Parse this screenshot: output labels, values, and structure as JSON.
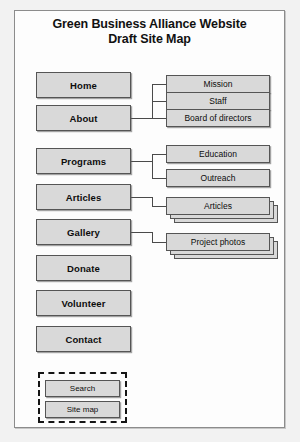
{
  "document": {
    "title_line1": "Green Business Alliance Website",
    "title_line2": "Draft Site Map"
  },
  "sitemap": {
    "primary_nodes": [
      {
        "id": "home",
        "label": "Home"
      },
      {
        "id": "about",
        "label": "About"
      },
      {
        "id": "programs",
        "label": "Programs"
      },
      {
        "id": "articles",
        "label": "Articles"
      },
      {
        "id": "gallery",
        "label": "Gallery"
      },
      {
        "id": "donate",
        "label": "Donate"
      },
      {
        "id": "volunteer",
        "label": "Volunteer"
      },
      {
        "id": "contact",
        "label": "Contact"
      }
    ],
    "about_children": [
      {
        "id": "mission",
        "label": "Mission"
      },
      {
        "id": "staff",
        "label": "Staff"
      },
      {
        "id": "board",
        "label": "Board of  directors"
      }
    ],
    "programs_children": [
      {
        "id": "education",
        "label": "Education"
      },
      {
        "id": "outreach",
        "label": "Outreach"
      }
    ],
    "articles_children": [
      {
        "id": "articles-pages",
        "label": "Articles",
        "stacked": true
      }
    ],
    "gallery_children": [
      {
        "id": "project-photos",
        "label": "Project photos",
        "stacked": true
      }
    ],
    "utility_nodes": [
      {
        "id": "search",
        "label": "Search"
      },
      {
        "id": "site-map",
        "label": "Site map"
      }
    ]
  },
  "style": {
    "box_fill": "#d9d9d9",
    "box_border": "#555555",
    "page_background": "#fdfdfd",
    "canvas_background": "#f2f2f2",
    "text_color": "#0d0d0d",
    "connector_color": "#4a4a4a"
  }
}
